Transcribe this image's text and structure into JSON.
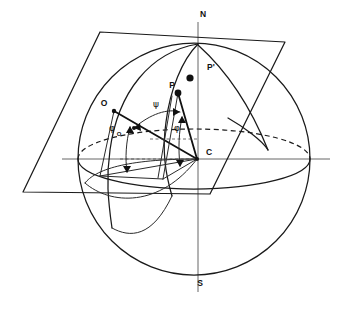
{
  "figure": {
    "background_color": "#ffffff",
    "line_color": "#1a1a1a",
    "width": 345,
    "height": 309
  },
  "labels": {
    "north_pole": "N",
    "south_pole": "S",
    "center": "C",
    "origin_point": "O",
    "point_p": "P",
    "point_p_prime": "P'",
    "angle_psi": "ψ",
    "angle_phi": "φ",
    "angle_phi_zero": "φ",
    "angle_phi_zero_subscript": "O"
  },
  "geometry": {
    "sphere": {
      "center_x": 194,
      "center_y": 159,
      "radius": 116
    },
    "polar_axis": {
      "x": 198,
      "y_top": 22,
      "y_bottom": 292
    },
    "equator_axis": {
      "y": 159,
      "x_left": 62,
      "x_right": 330
    },
    "plane_corners": [
      [
        100,
        32
      ],
      [
        285,
        42
      ],
      [
        210,
        194
      ],
      [
        23,
        192
      ]
    ]
  },
  "points": {
    "C": [
      197,
      159
    ],
    "P": [
      178,
      93
    ],
    "P_prime_dot": [
      190,
      78
    ],
    "O": [
      112,
      110
    ],
    "north_pole_point": [
      198,
      45
    ]
  }
}
